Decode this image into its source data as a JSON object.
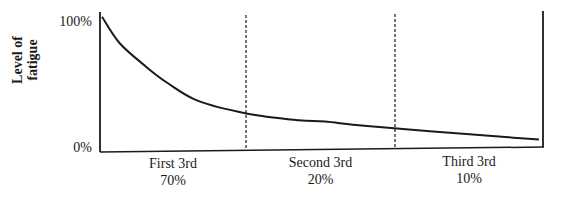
{
  "chart_data": {
    "type": "line",
    "title": "",
    "xlabel": "",
    "ylabel": "Level of fatigue",
    "ylabel_lines": [
      "Level of",
      "fatigue"
    ],
    "y_ticks": [
      "100%",
      "0%"
    ],
    "ylim": [
      0,
      100
    ],
    "grid": false,
    "legend": null,
    "sections": [
      {
        "label": "First 3rd",
        "value": "70%"
      },
      {
        "label": "Second 3rd",
        "value": "20%"
      },
      {
        "label": "Third 3rd",
        "value": "10%"
      }
    ],
    "dividers": [
      "dashed",
      "dashed"
    ],
    "series": [
      {
        "name": "Level of fatigue",
        "x": [
          0,
          4,
          10,
          15,
          22,
          33,
          45,
          51,
          60,
          75,
          100
        ],
        "values": [
          98,
          79,
          62,
          50,
          37,
          28,
          23,
          22,
          19,
          15,
          9
        ]
      }
    ],
    "annotations": [
      "Fatigue declines steeply during the first third",
      "Section percentages: 70%, 20%, 10%"
    ]
  },
  "axis": {
    "y_top_label": "100%",
    "y_bottom_label": "0%",
    "ylabel_line1": "Level of",
    "ylabel_line2": "fatigue"
  },
  "sections": [
    {
      "label": "First 3rd",
      "value": "70%"
    },
    {
      "label": "Second 3rd",
      "value": "20%"
    },
    {
      "label": "Third 3rd",
      "value": "10%"
    }
  ],
  "colors": {
    "ink": "#1a1a1a",
    "background": "#ffffff"
  }
}
